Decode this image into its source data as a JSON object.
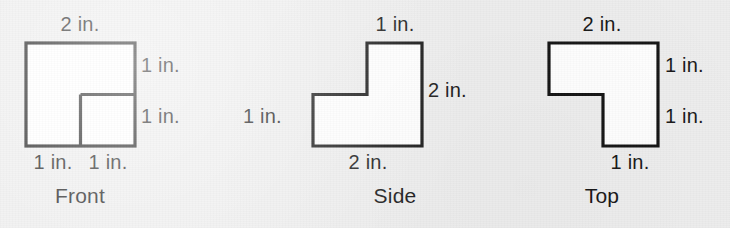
{
  "figure": {
    "unit": "in.",
    "background_color": "#eeeeee",
    "stroke_color": "#141414",
    "fill_color": "#ffffff",
    "text_color": "#171717",
    "views": [
      {
        "id": "front",
        "name": "Front",
        "outline": "square-with-inner-step-lines",
        "labels": {
          "top": "2 in.",
          "right_upper": "1 in.",
          "right_lower": "1 in.",
          "bottom_left": "1 in.",
          "bottom_right": "1 in."
        }
      },
      {
        "id": "side",
        "name": "Side",
        "outline": "L-shape-tall-right",
        "labels": {
          "top": "1 in.",
          "right": "2 in.",
          "left": "1 in.",
          "bottom": "2 in."
        }
      },
      {
        "id": "top",
        "name": "Top",
        "outline": "L-shape-wide-top",
        "labels": {
          "top": "2 in.",
          "right_upper": "1 in.",
          "right_lower": "1 in.",
          "bottom": "1 in."
        }
      }
    ]
  }
}
